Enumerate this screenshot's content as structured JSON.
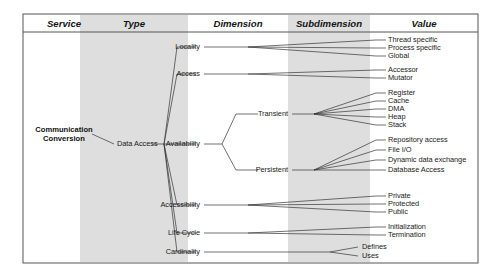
{
  "diagram": {
    "frame": {
      "x": 23,
      "y": 14,
      "width": 455,
      "height": 249
    },
    "header_rule_y": 32,
    "colors": {
      "band": "#dedede",
      "frame": "#555555",
      "line": "#333333",
      "text": "#1a1a1a"
    },
    "columns": [
      {
        "key": "service",
        "label": "Service",
        "cx": 64,
        "shaded": false,
        "band": null
      },
      {
        "key": "type",
        "label": "Type",
        "cx": 134,
        "shaded": true,
        "band": {
          "x": 80,
          "width": 108
        }
      },
      {
        "key": "dimension",
        "label": "Dimension",
        "cx": 238,
        "shaded": false,
        "band": null
      },
      {
        "key": "subdimension",
        "label": "Subdimension",
        "cx": 329,
        "shaded": true,
        "band": {
          "x": 288,
          "width": 82
        }
      },
      {
        "key": "value",
        "label": "Value",
        "cx": 424,
        "shaded": false,
        "band": null
      }
    ],
    "service": {
      "line1": "Communication",
      "line2": "Conversion",
      "x": 64,
      "y": 134
    },
    "type": {
      "label": "Data Access",
      "x": 117,
      "y": 144
    },
    "dimensions": [
      {
        "key": "locality",
        "label": "Locality",
        "x": 200,
        "y": 47
      },
      {
        "key": "access",
        "label": "Access",
        "x": 200,
        "y": 74
      },
      {
        "key": "availability",
        "label": "Availability",
        "x": 200,
        "y": 144
      },
      {
        "key": "accessibility",
        "label": "Accessibility",
        "x": 200,
        "y": 205
      },
      {
        "key": "lifecycle",
        "label": "Life Cycle",
        "x": 200,
        "y": 233
      },
      {
        "key": "cardinality",
        "label": "Cardinality",
        "x": 200,
        "y": 252
      }
    ],
    "subdimensions": [
      {
        "key": "transient",
        "label": "Transient",
        "x": 288,
        "y": 114,
        "parent": "availability"
      },
      {
        "key": "persistent",
        "label": "Persistent",
        "x": 288,
        "y": 170,
        "parent": "availability"
      },
      {
        "key": "defines",
        "label": "Defines",
        "x": 362,
        "y": 247,
        "parent": "cardinality"
      },
      {
        "key": "uses",
        "label": "Uses",
        "x": 362,
        "y": 256,
        "parent": "cardinality"
      }
    ],
    "values": [
      {
        "label": "Thread specific",
        "x": 388,
        "y": 40,
        "parent": "locality"
      },
      {
        "label": "Process specific",
        "x": 388,
        "y": 48,
        "parent": "locality"
      },
      {
        "label": "Global",
        "x": 388,
        "y": 56,
        "parent": "locality"
      },
      {
        "label": "Accessor",
        "x": 388,
        "y": 70,
        "parent": "access"
      },
      {
        "label": "Mutator",
        "x": 388,
        "y": 78,
        "parent": "access"
      },
      {
        "label": "Register",
        "x": 388,
        "y": 93,
        "parent": "transient"
      },
      {
        "label": "Cache",
        "x": 388,
        "y": 101,
        "parent": "transient"
      },
      {
        "label": "DMA",
        "x": 388,
        "y": 109,
        "parent": "transient"
      },
      {
        "label": "Heap",
        "x": 388,
        "y": 117,
        "parent": "transient"
      },
      {
        "label": "Stack",
        "x": 388,
        "y": 125,
        "parent": "transient"
      },
      {
        "label": "Repository access",
        "x": 388,
        "y": 140,
        "parent": "persistent"
      },
      {
        "label": "Dynamic data exchange",
        "x": 388,
        "y": 160,
        "parent": "persistent"
      },
      {
        "label": "File I/O",
        "x": 388,
        "y": 150,
        "parent": "persistent"
      },
      {
        "label": "Database Access",
        "x": 388,
        "y": 170,
        "parent": "persistent"
      },
      {
        "label": "Private",
        "x": 388,
        "y": 196,
        "parent": "accessibility"
      },
      {
        "label": "Protected",
        "x": 388,
        "y": 204,
        "parent": "accessibility"
      },
      {
        "label": "Public",
        "x": 388,
        "y": 212,
        "parent": "accessibility"
      },
      {
        "label": "Initialization",
        "x": 388,
        "y": 227,
        "parent": "lifecycle"
      },
      {
        "label": "Termination",
        "x": 388,
        "y": 235,
        "parent": "lifecycle"
      }
    ]
  }
}
